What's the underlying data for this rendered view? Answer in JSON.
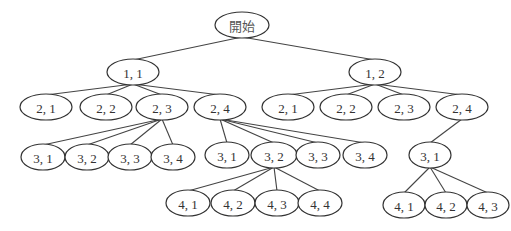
{
  "diagram": {
    "type": "tree",
    "nodes": [
      {
        "id": "root",
        "label": "開始",
        "x": 242,
        "y": 25,
        "rx": 27,
        "ry": 13
      },
      {
        "id": "n11",
        "label": "1, 1",
        "x": 133,
        "y": 72,
        "rx": 26,
        "ry": 13
      },
      {
        "id": "n12",
        "label": "1, 2",
        "x": 375,
        "y": 72,
        "rx": 26,
        "ry": 13
      },
      {
        "id": "L_21",
        "label": "2, 1",
        "x": 46,
        "y": 107,
        "rx": 26,
        "ry": 13
      },
      {
        "id": "L_22",
        "label": "2, 2",
        "x": 106,
        "y": 107,
        "rx": 26,
        "ry": 13
      },
      {
        "id": "L_23",
        "label": "2, 3",
        "x": 162,
        "y": 107,
        "rx": 26,
        "ry": 13
      },
      {
        "id": "L_24",
        "label": "2, 4",
        "x": 220,
        "y": 107,
        "rx": 26,
        "ry": 13
      },
      {
        "id": "R_21",
        "label": "2, 1",
        "x": 288,
        "y": 107,
        "rx": 26,
        "ry": 13
      },
      {
        "id": "R_22",
        "label": "2, 2",
        "x": 346,
        "y": 107,
        "rx": 26,
        "ry": 13
      },
      {
        "id": "R_23",
        "label": "2, 3",
        "x": 404,
        "y": 107,
        "rx": 26,
        "ry": 13
      },
      {
        "id": "R_24",
        "label": "2, 4",
        "x": 462,
        "y": 107,
        "rx": 26,
        "ry": 13
      },
      {
        "id": "L23_31",
        "label": "3, 1",
        "x": 43,
        "y": 157,
        "rx": 22,
        "ry": 13
      },
      {
        "id": "L23_32",
        "label": "3, 2",
        "x": 87,
        "y": 157,
        "rx": 22,
        "ry": 13
      },
      {
        "id": "L23_33",
        "label": "3, 3",
        "x": 130,
        "y": 157,
        "rx": 22,
        "ry": 13
      },
      {
        "id": "L23_34",
        "label": "3, 4",
        "x": 173,
        "y": 157,
        "rx": 22,
        "ry": 13
      },
      {
        "id": "L24_31",
        "label": "3, 1",
        "x": 227,
        "y": 155,
        "rx": 22,
        "ry": 13
      },
      {
        "id": "L24_32",
        "label": "3, 2",
        "x": 274,
        "y": 155,
        "rx": 23,
        "ry": 13
      },
      {
        "id": "L24_33",
        "label": "3, 3",
        "x": 318,
        "y": 155,
        "rx": 22,
        "ry": 13
      },
      {
        "id": "L24_34",
        "label": "3, 4",
        "x": 365,
        "y": 155,
        "rx": 22,
        "ry": 13
      },
      {
        "id": "R24_31",
        "label": "3, 1",
        "x": 430,
        "y": 155,
        "rx": 21,
        "ry": 13
      },
      {
        "id": "L2432_41",
        "label": "4, 1",
        "x": 188,
        "y": 203,
        "rx": 22,
        "ry": 13
      },
      {
        "id": "L2432_42",
        "label": "4, 2",
        "x": 233,
        "y": 203,
        "rx": 22,
        "ry": 13
      },
      {
        "id": "L2432_43",
        "label": "4, 3",
        "x": 277,
        "y": 203,
        "rx": 22,
        "ry": 13
      },
      {
        "id": "L2432_44",
        "label": "4, 4",
        "x": 320,
        "y": 203,
        "rx": 22,
        "ry": 13
      },
      {
        "id": "R2431_41",
        "label": "4, 1",
        "x": 404,
        "y": 205,
        "rx": 21,
        "ry": 13
      },
      {
        "id": "R2431_42",
        "label": "4, 2",
        "x": 446,
        "y": 205,
        "rx": 21,
        "ry": 13
      },
      {
        "id": "R2431_43",
        "label": "4, 3",
        "x": 488,
        "y": 205,
        "rx": 21,
        "ry": 13
      }
    ],
    "edges": [
      [
        "root",
        "n11"
      ],
      [
        "root",
        "n12"
      ],
      [
        "n11",
        "L_21"
      ],
      [
        "n11",
        "L_22"
      ],
      [
        "n11",
        "L_23"
      ],
      [
        "n11",
        "L_24"
      ],
      [
        "n12",
        "R_21"
      ],
      [
        "n12",
        "R_22"
      ],
      [
        "n12",
        "R_23"
      ],
      [
        "n12",
        "R_24"
      ],
      [
        "L_23",
        "L23_31"
      ],
      [
        "L_23",
        "L23_32"
      ],
      [
        "L_23",
        "L23_33"
      ],
      [
        "L_23",
        "L23_34"
      ],
      [
        "L_24",
        "L24_31"
      ],
      [
        "L_24",
        "L24_32"
      ],
      [
        "L_24",
        "L24_33"
      ],
      [
        "L_24",
        "L24_34"
      ],
      [
        "R_24",
        "R24_31"
      ],
      [
        "L24_32",
        "L2432_41"
      ],
      [
        "L24_32",
        "L2432_42"
      ],
      [
        "L24_32",
        "L2432_43"
      ],
      [
        "L24_32",
        "L2432_44"
      ],
      [
        "R24_31",
        "R2431_41"
      ],
      [
        "R24_31",
        "R2431_42"
      ],
      [
        "R24_31",
        "R2431_43"
      ]
    ]
  }
}
